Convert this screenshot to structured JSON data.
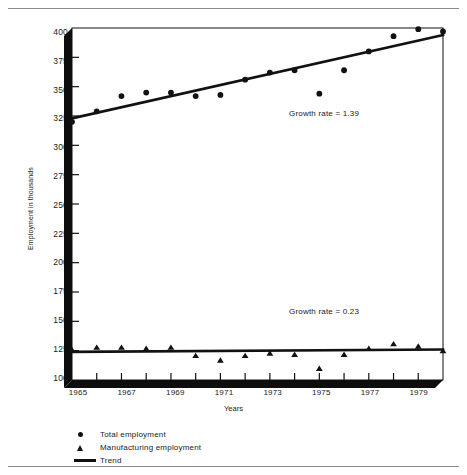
{
  "chart_data": {
    "type": "scatter",
    "title": "",
    "xlabel": "Years",
    "ylabel": "Employment in thousands",
    "xlim": [
      1965,
      1980
    ],
    "ylim": [
      100,
      400
    ],
    "x_ticks": [
      1965,
      1967,
      1969,
      1971,
      1973,
      1975,
      1977,
      1979
    ],
    "x_tick_labels": [
      "1965",
      "1967",
      "1969",
      "1971",
      "1973",
      "1975",
      "1977",
      "1979"
    ],
    "x_minor_ticks": [
      1966,
      1968,
      1970,
      1972,
      1974,
      1976,
      1978,
      1980
    ],
    "y_ticks": [
      100,
      125,
      150,
      175,
      200,
      225,
      250,
      275,
      300,
      325,
      350,
      375,
      400
    ],
    "y_tick_labels": [
      "100",
      "125",
      "150",
      "175",
      "200",
      "225",
      "250",
      "275",
      "300",
      "325",
      "350",
      "375",
      "400"
    ],
    "grid": false,
    "legend_position": "below-plot",
    "series": [
      {
        "name": "Total employment",
        "marker": "circle",
        "x": [
          1965,
          1966,
          1967,
          1968,
          1969,
          1970,
          1971,
          1972,
          1973,
          1974,
          1975,
          1976,
          1977,
          1978,
          1979,
          1980
        ],
        "values": [
          320,
          329,
          342,
          345,
          345,
          342,
          343,
          356,
          362,
          364,
          344,
          364,
          380,
          393,
          399,
          397
        ]
      },
      {
        "name": "Manufacturing employment",
        "marker": "triangle",
        "x": [
          1965,
          1966,
          1967,
          1968,
          1969,
          1970,
          1971,
          1972,
          1973,
          1974,
          1975,
          1976,
          1977,
          1978,
          1979,
          1980
        ],
        "values": [
          126,
          128,
          128,
          127,
          128,
          121,
          117,
          121,
          123,
          122,
          110,
          122,
          127,
          131,
          129,
          125
        ]
      }
    ],
    "trend_lines": [
      {
        "name": "Trend",
        "series": "Total employment",
        "x": [
          1965,
          1980
        ],
        "y": [
          323,
          394
        ],
        "growth_rate": 1.39,
        "annotation": "Growth rate  =  1.39"
      },
      {
        "name": "Trend",
        "series": "Manufacturing employment",
        "x": [
          1965,
          1980
        ],
        "y": [
          124,
          126
        ],
        "growth_rate": 0.23,
        "annotation": "Growth rate  =  0.23"
      }
    ],
    "annotations": [
      {
        "text": "Growth rate  =  1.39",
        "x": 1974.2,
        "y": 313
      },
      {
        "text": "Growth rate  =  0.23",
        "x": 1974.2,
        "y": 153
      }
    ],
    "legend": [
      {
        "label": "Total employment",
        "marker": "circle"
      },
      {
        "label": "Manufacturing employment",
        "marker": "triangle"
      },
      {
        "label": "Trend",
        "marker": "line"
      }
    ],
    "colors": {
      "ink": "#111111",
      "axis": "#0d0d0d",
      "rule": "#8a8a8a",
      "background": "#ffffff"
    }
  }
}
